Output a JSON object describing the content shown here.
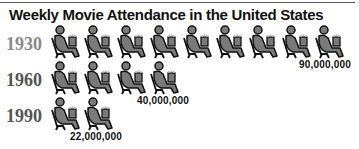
{
  "title": "Weekly Movie Attendance in the United States",
  "colors": {
    "icon_fill": "#7a7a7a",
    "icon_stroke": "#111111",
    "year_1930": "#8a8a8a",
    "year_other": "#555555",
    "text": "#111111"
  },
  "icon_unit": 10000000,
  "rows": [
    {
      "year": "1930",
      "icons": 9,
      "label": "90,000,000"
    },
    {
      "year": "1960",
      "icons": 4,
      "label": "40,000,000"
    },
    {
      "year": "1990",
      "icons": 2,
      "label": "22,000,000"
    }
  ],
  "chart_data": {
    "type": "pictograph",
    "title": "Weekly Movie Attendance in the United States",
    "categories": [
      "1930",
      "1960",
      "1990"
    ],
    "values": [
      90000000,
      40000000,
      22000000
    ],
    "value_labels": [
      "90,000,000",
      "40,000,000",
      "22,000,000"
    ],
    "icon": "moviegoer-in-seat-with-popcorn",
    "icon_counts": [
      9,
      4,
      2
    ],
    "xlabel": "",
    "ylabel": ""
  }
}
